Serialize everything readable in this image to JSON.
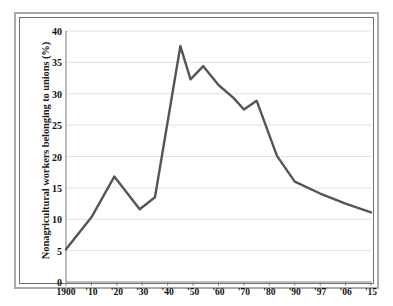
{
  "figure": {
    "frame": "double-ruled-border",
    "background_color": "#ffffff",
    "line_color": "#555555",
    "grid_color": "#d9d9d9",
    "axis_color": "#808080"
  },
  "caption": "",
  "chart_data": {
    "type": "line",
    "title": "",
    "xlabel": "",
    "ylabel": "Nonagricultural workers belonging to unions (%)",
    "ylim": [
      0,
      40
    ],
    "yticks": [
      0,
      5,
      10,
      15,
      20,
      25,
      30,
      35,
      40
    ],
    "ytick_labels": [
      "0",
      "5",
      "10",
      "15",
      "20",
      "25",
      "30",
      "35",
      "40"
    ],
    "grid": "horizontal",
    "legend": "none",
    "xtick_labels": [
      "1900",
      "'10",
      "'20",
      "'30",
      "'40",
      "'50",
      "'60",
      "'70",
      "'80",
      "'90",
      "'97",
      "'06",
      "'15"
    ],
    "x": [
      1900,
      1910,
      1920,
      1930,
      1940,
      1950,
      1960,
      1970,
      1980,
      1990,
      1997,
      2006,
      2015
    ],
    "series": [
      {
        "name": "Union membership",
        "points": [
          {
            "year": 1900,
            "value": 5.2
          },
          {
            "year": 1910,
            "value": 10.3
          },
          {
            "year": 1919,
            "value": 16.8
          },
          {
            "year": 1929,
            "value": 11.6
          },
          {
            "year": 1935,
            "value": 13.5
          },
          {
            "year": 1945,
            "value": 37.6
          },
          {
            "year": 1949,
            "value": 32.3
          },
          {
            "year": 1954,
            "value": 34.4
          },
          {
            "year": 1960,
            "value": 31.4
          },
          {
            "year": 1966,
            "value": 29.3
          },
          {
            "year": 1970,
            "value": 27.5
          },
          {
            "year": 1975,
            "value": 28.9
          },
          {
            "year": 1983,
            "value": 20.1
          },
          {
            "year": 1990,
            "value": 16.0
          },
          {
            "year": 1997,
            "value": 14.1
          },
          {
            "year": 2006,
            "value": 12.5
          },
          {
            "year": 2015,
            "value": 11.1
          }
        ]
      }
    ]
  }
}
